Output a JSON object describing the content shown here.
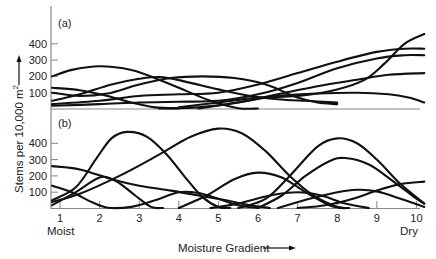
{
  "chart_data": {
    "type": "line",
    "title": "",
    "xlabel": "Moisture Gradient",
    "ylabel": "Stems per 10,000 m²",
    "x_ticks": [
      1,
      2,
      3,
      4,
      5,
      6,
      7,
      8,
      9,
      10
    ],
    "x_end_labels": {
      "left": "Moist",
      "right": "Dry"
    },
    "y_ticks": [
      100,
      200,
      300,
      400
    ],
    "xlim": [
      0.8,
      10.2
    ],
    "ylim": [
      0,
      500
    ],
    "grid": false,
    "legend": null,
    "panels": [
      {
        "label": "(a)",
        "description": "Broadly overlapping species distributions along the moisture gradient",
        "series": [
          {
            "name": "a1",
            "points": [
              [
                0.8,
                200
              ],
              [
                1.3,
                240
              ],
              [
                2,
                262
              ],
              [
                2.8,
                240
              ],
              [
                3.5,
                180
              ],
              [
                4.2,
                110
              ],
              [
                4.8,
                50
              ],
              [
                5.5,
                5
              ],
              [
                6,
                0
              ]
            ]
          },
          {
            "name": "a2",
            "points": [
              [
                0.8,
                130
              ],
              [
                1.5,
                115
              ],
              [
                2.2,
                80
              ],
              [
                2.8,
                40
              ],
              [
                3.4,
                10
              ],
              [
                4,
                0
              ]
            ]
          },
          {
            "name": "a3",
            "points": [
              [
                0.8,
                100
              ],
              [
                1.5,
                80
              ],
              [
                2.2,
                95
              ],
              [
                3,
                150
              ],
              [
                3.8,
                190
              ],
              [
                4.6,
                200
              ],
              [
                5.4,
                190
              ],
              [
                6.2,
                150
              ],
              [
                7,
                70
              ],
              [
                7.5,
                40
              ],
              [
                8,
                30
              ]
            ]
          },
          {
            "name": "a4",
            "points": [
              [
                0.8,
                50
              ],
              [
                1.5,
                90
              ],
              [
                2.3,
                150
              ],
              [
                3,
                185
              ],
              [
                3.6,
                195
              ],
              [
                4.3,
                160
              ],
              [
                5,
                120
              ],
              [
                5.8,
                80
              ],
              [
                6.5,
                60
              ],
              [
                7.2,
                50
              ],
              [
                8,
                40
              ]
            ]
          },
          {
            "name": "a5",
            "points": [
              [
                0.8,
                30
              ],
              [
                2,
                50
              ],
              [
                3,
                80
              ],
              [
                4,
                90
              ],
              [
                5,
                100
              ],
              [
                6,
                150
              ],
              [
                7,
                220
              ],
              [
                8,
                290
              ],
              [
                9,
                350
              ],
              [
                9.7,
                370
              ],
              [
                10.2,
                370
              ]
            ]
          },
          {
            "name": "a6",
            "points": [
              [
                0.8,
                20
              ],
              [
                2,
                30
              ],
              [
                3,
                40
              ],
              [
                4,
                45
              ],
              [
                5,
                50
              ],
              [
                6,
                90
              ],
              [
                7,
                160
              ],
              [
                8,
                250
              ],
              [
                9,
                310
              ],
              [
                9.7,
                330
              ],
              [
                10.2,
                330
              ]
            ]
          },
          {
            "name": "a7",
            "points": [
              [
                3.5,
                0
              ],
              [
                4.5,
                10
              ],
              [
                5.5,
                40
              ],
              [
                6.5,
                90
              ],
              [
                7.5,
                140
              ],
              [
                8.5,
                180
              ],
              [
                9.3,
                210
              ],
              [
                10.2,
                220
              ]
            ]
          },
          {
            "name": "a8",
            "points": [
              [
                4,
                10
              ],
              [
                5,
                40
              ],
              [
                6,
                70
              ],
              [
                7,
                80
              ],
              [
                8,
                120
              ],
              [
                8.7,
                180
              ],
              [
                9.2,
                280
              ],
              [
                9.7,
                400
              ],
              [
                10.2,
                460
              ]
            ]
          },
          {
            "name": "a9",
            "points": [
              [
                4.5,
                0
              ],
              [
                5.5,
                40
              ],
              [
                6.5,
                80
              ],
              [
                7.5,
                95
              ],
              [
                8.5,
                100
              ],
              [
                9.3,
                90
              ],
              [
                9.8,
                70
              ],
              [
                10.2,
                40
              ]
            ]
          }
        ]
      },
      {
        "label": "(b)",
        "description": "More sharply peaked, distinct species distributions along the moisture gradient",
        "series": [
          {
            "name": "b1",
            "points": [
              [
                0.8,
                50
              ],
              [
                1.4,
                130
              ],
              [
                1.9,
                300
              ],
              [
                2.3,
                430
              ],
              [
                2.7,
                470
              ],
              [
                3.2,
                440
              ],
              [
                3.7,
                330
              ],
              [
                4.2,
                180
              ],
              [
                4.6,
                70
              ],
              [
                5,
                10
              ],
              [
                5.3,
                0
              ]
            ]
          },
          {
            "name": "b2",
            "points": [
              [
                0.8,
                40
              ],
              [
                1.5,
                90
              ],
              [
                2.5,
                200
              ],
              [
                3.5,
                330
              ],
              [
                4.3,
                440
              ],
              [
                5,
                490
              ],
              [
                5.6,
                460
              ],
              [
                6.2,
                350
              ],
              [
                6.8,
                200
              ],
              [
                7.4,
                80
              ],
              [
                8,
                10
              ],
              [
                8.3,
                0
              ]
            ]
          },
          {
            "name": "b3",
            "points": [
              [
                0.8,
                260
              ],
              [
                1.5,
                240
              ],
              [
                2.3,
                180
              ],
              [
                3,
                140
              ],
              [
                3.8,
                110
              ],
              [
                4.5,
                80
              ],
              [
                5.2,
                50
              ],
              [
                5.8,
                20
              ],
              [
                6.3,
                0
              ]
            ]
          },
          {
            "name": "b4",
            "points": [
              [
                0.8,
                140
              ],
              [
                1.3,
                100
              ],
              [
                1.8,
                40
              ],
              [
                2.2,
                5
              ],
              [
                2.8,
                10
              ],
              [
                3.4,
                50
              ],
              [
                4,
                100
              ],
              [
                4.5,
                95
              ],
              [
                5,
                60
              ],
              [
                5.5,
                20
              ],
              [
                6,
                0
              ]
            ]
          },
          {
            "name": "b5",
            "points": [
              [
                0.8,
                20
              ],
              [
                1.4,
                100
              ],
              [
                2,
                190
              ],
              [
                2.4,
                170
              ],
              [
                2.9,
                80
              ],
              [
                3.3,
                10
              ],
              [
                3.6,
                0
              ]
            ]
          },
          {
            "name": "b6",
            "points": [
              [
                4,
                0
              ],
              [
                4.7,
                80
              ],
              [
                5.4,
                180
              ],
              [
                6,
                220
              ],
              [
                6.6,
                190
              ],
              [
                7.2,
                100
              ],
              [
                7.8,
                20
              ],
              [
                8.2,
                0
              ]
            ]
          },
          {
            "name": "b7",
            "points": [
              [
                5.5,
                0
              ],
              [
                6.2,
                60
              ],
              [
                6.8,
                200
              ],
              [
                7.5,
                380
              ],
              [
                8,
                430
              ],
              [
                8.5,
                400
              ],
              [
                9,
                300
              ],
              [
                9.6,
                150
              ],
              [
                10.2,
                30
              ]
            ]
          },
          {
            "name": "b8",
            "points": [
              [
                6,
                0
              ],
              [
                6.6,
                80
              ],
              [
                7.2,
                200
              ],
              [
                7.8,
                290
              ],
              [
                8.2,
                310
              ],
              [
                8.8,
                270
              ],
              [
                9.4,
                170
              ],
              [
                10,
                60
              ],
              [
                10.2,
                30
              ]
            ]
          },
          {
            "name": "b9",
            "points": [
              [
                7,
                0
              ],
              [
                7.7,
                20
              ],
              [
                8.4,
                60
              ],
              [
                9,
                110
              ],
              [
                9.6,
                150
              ],
              [
                10.2,
                165
              ]
            ]
          },
          {
            "name": "b10",
            "points": [
              [
                6.5,
                0
              ],
              [
                7.3,
                60
              ],
              [
                8,
                100
              ],
              [
                8.5,
                115
              ],
              [
                9,
                105
              ],
              [
                9.6,
                60
              ],
              [
                10.2,
                10
              ]
            ]
          },
          {
            "name": "b11",
            "points": [
              [
                4.8,
                0
              ],
              [
                5.5,
                30
              ],
              [
                6.3,
                80
              ],
              [
                7,
                100
              ],
              [
                7.6,
                80
              ],
              [
                8.2,
                30
              ],
              [
                8.8,
                0
              ]
            ]
          }
        ]
      }
    ]
  },
  "labels": {
    "panel_a": "(a)",
    "panel_b": "(b)",
    "y_axis_title": "Stems per 10,000 m",
    "y_axis_superscript": "2",
    "x_axis_title": "Moisture Gradient",
    "moist": "Moist",
    "dry": "Dry"
  }
}
